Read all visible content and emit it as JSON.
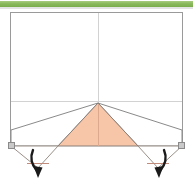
{
  "page": {
    "background_color": "#ffffff",
    "width": 193,
    "height": 183
  },
  "top_band": {
    "name": "green-divider-band",
    "color": "#8cba5e",
    "highlight_color": "#a9cc80",
    "shade_color": "#7aad4c",
    "shadow_color": "#d9d9d9",
    "x": 0,
    "y": 1,
    "width": 193,
    "height": 6
  },
  "diagram": {
    "frame": {
      "name": "outer-rectangle",
      "label": "",
      "stroke": "#9a9a9a",
      "fill": "#ffffff",
      "x": 10,
      "y": 12,
      "width": 173,
      "height": 133
    },
    "guides": {
      "stroke": "#cfcfcf",
      "vertical_line": {
        "name": "vertical-center-guide",
        "x1": 98,
        "y1": 13,
        "x2": 98,
        "y2": 146
      },
      "horizontal_line": {
        "name": "horizontal-fold-guide",
        "x1": 11,
        "y1": 101,
        "x2": 182,
        "y2": 101
      }
    },
    "apex": {
      "name": "apex-point",
      "x": 98,
      "y": 103
    },
    "center_triangle": {
      "name": "center-fold-triangle",
      "fill": "#f7c5a8",
      "stroke": "#8a7f78",
      "points": "98,103 58,146 138,146"
    },
    "left_flap": {
      "name": "left-flap-polygon",
      "fill": "#ffffff",
      "stroke": "#8a8a8a",
      "points": "98,103 11,130 11,146 58,146"
    },
    "right_flap": {
      "name": "right-flap-polygon",
      "fill": "#ffffff",
      "stroke": "#8a8a8a",
      "points": "98,103 182,130 182,146 138,146"
    },
    "left_lower_wedge": {
      "name": "left-lower-wedge",
      "fill": "#ffffff",
      "stroke": "#9a8f88",
      "points": "11,146 58,146 38,168"
    },
    "right_lower_wedge": {
      "name": "right-lower-wedge",
      "fill": "#ffffff",
      "stroke": "#9a8f88",
      "points": "182,146 138,146 158,168"
    },
    "base_marks": {
      "name": "base-fold-marks",
      "stroke": "#c08b7a",
      "left": {
        "x1": 27,
        "y1": 163,
        "x2": 49,
        "y2": 163
      },
      "right": {
        "x1": 147,
        "y1": 163,
        "x2": 169,
        "y2": 163
      }
    },
    "corner_markers": [
      {
        "name": "corner-marker-bottom-left",
        "x": 8,
        "y": 143,
        "size": 6,
        "fill": "#c9c9c9",
        "stroke": "#8a8a8a"
      },
      {
        "name": "corner-marker-bottom-right",
        "x": 179,
        "y": 143,
        "size": 6,
        "fill": "#c9c9c9",
        "stroke": "#8a8a8a"
      }
    ],
    "arrows": [
      {
        "name": "left-fold-direction-arrow",
        "color": "#1a1a1a",
        "tail_path": "M 34 150 C 31 157, 32 164, 38 172",
        "head_points": "38,177 34,167 42,167"
      },
      {
        "name": "right-fold-direction-arrow",
        "color": "#1a1a1a",
        "tail_path": "M 163 150 C 166 157, 164 164, 158 172",
        "head_points": "158,177 154,167 162,167"
      }
    ]
  }
}
